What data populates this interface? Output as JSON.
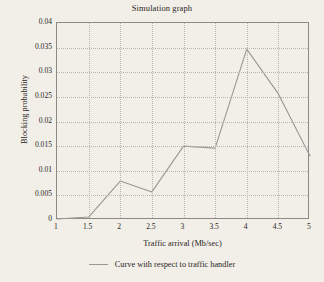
{
  "chart_data": {
    "type": "line",
    "title": "Simulation graph",
    "xlabel": "Traffic arrival (Mb/sec)",
    "ylabel": "Blocking probability",
    "x": [
      1,
      1.5,
      2,
      2.5,
      3,
      3.5,
      4,
      4.5,
      5
    ],
    "xticklabels": [
      "1",
      "1.5",
      "2",
      "2.5",
      "3",
      "3.5",
      "4",
      "4.5",
      "5"
    ],
    "yticklabels": [
      "0",
      "0.005",
      "0.01",
      "0.015",
      "0.02",
      "0.025",
      "0.03",
      "0.035",
      "0.04"
    ],
    "yticks": [
      0,
      0.005,
      0.01,
      0.015,
      0.02,
      0.025,
      0.03,
      0.035,
      0.04
    ],
    "xlim": [
      1,
      5
    ],
    "ylim": [
      0,
      0.04
    ],
    "grid": true,
    "legend_position": "below",
    "series": [
      {
        "name": "Curve with respect to traffic handler",
        "color": "#9b9691",
        "values": [
          0.0002,
          0.0006,
          0.0079,
          0.0057,
          0.015,
          0.0146,
          0.0347,
          0.0256,
          0.013
        ]
      }
    ]
  },
  "legend": {
    "entries": [
      {
        "label": "Curve with respect to traffic handler",
        "marker": "line-swatch"
      }
    ]
  }
}
